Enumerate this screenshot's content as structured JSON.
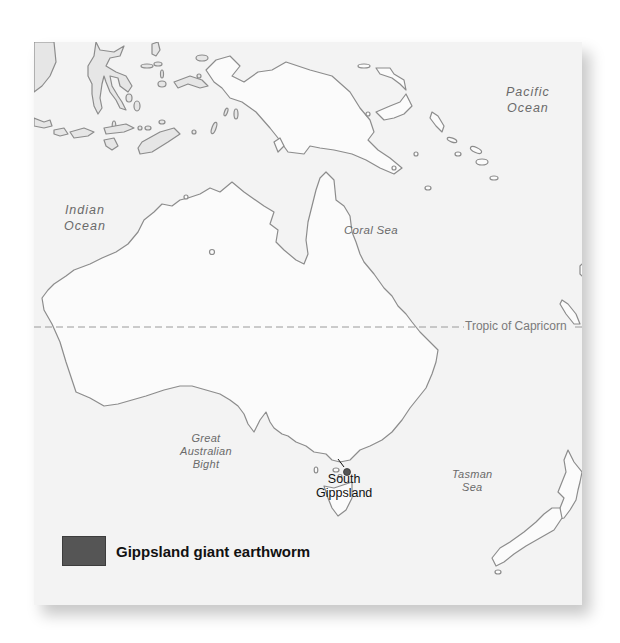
{
  "map": {
    "region": "Australia and surrounding region",
    "labels": {
      "pacific": [
        "Pacific",
        "Ocean"
      ],
      "indian": [
        "Indian",
        "Ocean"
      ],
      "coral": "Coral Sea",
      "bight": [
        "Great",
        "Australian",
        "Bight"
      ],
      "tasman": [
        "Tasman",
        "Sea"
      ],
      "tropic": "Tropic of Capricorn"
    },
    "location": {
      "name_line1": "South",
      "name_line2": "Gippsland",
      "marker_color": "#555555"
    }
  },
  "legend": {
    "items": [
      {
        "label": "Gippsland giant earthworm",
        "color": "#555555"
      }
    ]
  },
  "colors": {
    "sea": "#f3f3f3",
    "land_main": "#fbfbfb",
    "land_islands": "#e6e6e6",
    "coastline": "#8a8a8a"
  }
}
